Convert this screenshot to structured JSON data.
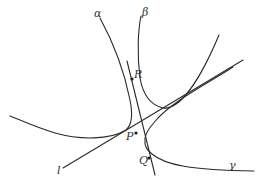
{
  "figure": {
    "type": "geometric diagram",
    "curves": [
      {
        "id": "alpha",
        "label": "α"
      },
      {
        "id": "beta",
        "label": "β"
      },
      {
        "id": "gamma",
        "label": "γ"
      }
    ],
    "lines": [
      {
        "id": "l",
        "label": "l"
      },
      {
        "id": "rpq",
        "label": ""
      }
    ],
    "points": [
      {
        "id": "R",
        "label": "R"
      },
      {
        "id": "P",
        "label": "P"
      },
      {
        "id": "Q",
        "label": "Q"
      }
    ]
  },
  "colors": {
    "stroke": "#2a2a2a",
    "background": "#ffffff"
  }
}
